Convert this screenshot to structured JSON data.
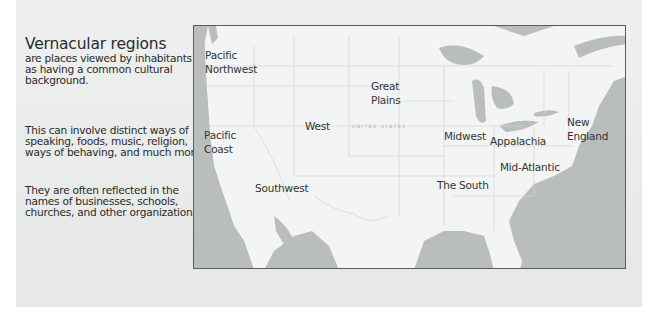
{
  "slide": {
    "title": "Vernacular regions",
    "paragraphs": [
      "are places viewed by inhabitants as having a common cultural background.",
      "This can involve distinct ways of speaking, foods, music, religion, ways of behaving, and much more.",
      "They are often reflected in the names of  businesses, schools, churches, and other organizations."
    ]
  },
  "map": {
    "country_label": "UNITED STATES",
    "colors": {
      "water": "#b9bebd",
      "land": "#f3f4f4",
      "borders": "#d3d6d6",
      "frame": "#5c5c5c"
    },
    "regions": [
      {
        "name": "Pacific Northwest",
        "text": "Pacific\nNorthwest"
      },
      {
        "name": "Pacific Coast",
        "text": "Pacific\nCoast"
      },
      {
        "name": "West",
        "text": "West"
      },
      {
        "name": "Great Plains",
        "text": "Great\nPlains"
      },
      {
        "name": "Midwest",
        "text": "Midwest"
      },
      {
        "name": "New England",
        "text": "New\nEngland"
      },
      {
        "name": "Appalachia",
        "text": "Appalachia"
      },
      {
        "name": "Mid-Atlantic",
        "text": "Mid-Atlantic"
      },
      {
        "name": "Southwest",
        "text": "Southwest"
      },
      {
        "name": "The South",
        "text": "The South"
      }
    ]
  }
}
